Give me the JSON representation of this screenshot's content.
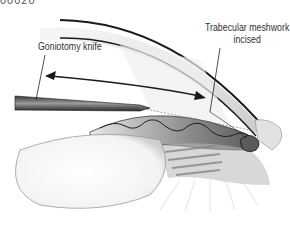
{
  "figure": {
    "id_label": "00020"
  },
  "labels": {
    "knife": "Goniotomy knife",
    "meshwork_line1": "Trabecular meshwork",
    "meshwork_line2": "incised"
  },
  "colors": {
    "background": "#ffffff",
    "line": "#1a1a1a",
    "shade_dark": "#6e6e6e",
    "shade_mid": "#a9a9a9",
    "shade_light": "#d9d9d9"
  }
}
